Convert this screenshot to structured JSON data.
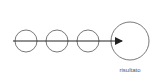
{
  "diagram": {
    "nodes": [
      {
        "id": "step-1",
        "type": "small-circle"
      },
      {
        "id": "step-2",
        "type": "small-circle"
      },
      {
        "id": "step-3",
        "type": "small-circle"
      },
      {
        "id": "result",
        "type": "large-circle",
        "label": "risultato"
      }
    ],
    "edges": [
      {
        "from": "step-1",
        "to": "result",
        "type": "arrow",
        "through": [
          "step-2",
          "step-3"
        ]
      }
    ],
    "result_label": "risultato",
    "colors": {
      "stroke": "#555555",
      "arrow": "#222222",
      "background": "#ffffff"
    }
  }
}
